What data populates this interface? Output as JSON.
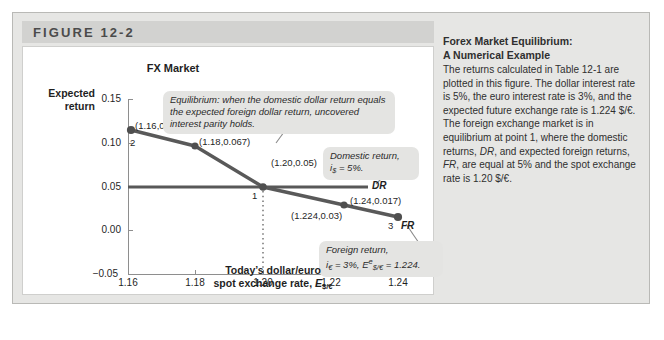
{
  "figure": {
    "header_label": "FIGURE 12-2",
    "chart_title": "FX Market"
  },
  "caption": {
    "title": "Forex Market Equilibrium:\nA Numerical Example",
    "body_html": "The returns calculated in Table 12-1 are plotted in this figure. The dollar interest rate is 5%, the euro interest rate is 3%, and the expected future exchange rate is 1.224 $/€. The foreign exchange market is in equilibrium at point 1, where the domestic returns, <i>DR</i>, and expected foreign returns, <i>FR</i>, are equal at 5% and the spot exchange rate is 1.20 $/€."
  },
  "axes": {
    "ylabel": "Expected\nreturn",
    "xlabel_line1": "Today’s dollar/euro",
    "xlabel_line2_prefix": "spot exchange rate, ",
    "xlabel_symbol": "E",
    "xlabel_symbol_sub": "$/€",
    "yticks": [
      "0.15",
      "0.10",
      "0.05",
      "0.00",
      "−0.05"
    ],
    "xticks": [
      "1.16",
      "1.18",
      "1.20",
      "1.22",
      "1.24"
    ]
  },
  "annotations": {
    "equilibrium_callout": "Equilibrium: when the domestic dollar return equals the expected foreign dollar return, uncovered interest parity holds.",
    "domestic_callout_line1": "Domestic return,",
    "domestic_callout_line2_prefix": "i",
    "domestic_callout_line2_sub": "$",
    "domestic_callout_line2_rest": " = 5%.",
    "foreign_callout_line1": "Foreign return,",
    "foreign_callout_line2_a_prefix": "i",
    "foreign_callout_line2_a_sub": "€",
    "foreign_callout_line2_a_rest": " = 3%, ",
    "foreign_callout_line2_b_symbol": "E",
    "foreign_callout_line2_b_sup": "e",
    "foreign_callout_line2_b_sub": "$/€",
    "foreign_callout_line2_b_rest": " = 1.224.",
    "dr_tag": "DR",
    "fr_tag": "FR"
  },
  "point_numbers": {
    "p2": "2",
    "p1": "1",
    "p3": "3"
  },
  "colors": {
    "fr_line": "#595959",
    "dr_line": "#585858",
    "marker": "#4f4f4f",
    "axis": "#8e8e8e",
    "callout_bg": "#e4e4e2",
    "frame_bg": "#e6e6e4",
    "header_bg": "#d2d2d0"
  },
  "chart_data": {
    "type": "line",
    "title": "FX Market",
    "xlabel": "Today’s dollar/euro spot exchange rate, E$/€",
    "ylabel": "Expected return",
    "xlim": [
      1.16,
      1.24
    ],
    "ylim": [
      -0.05,
      0.15
    ],
    "grid": false,
    "legend_position": "inline-right",
    "series": [
      {
        "name": "FR",
        "label": "Foreign return (expected)",
        "x": [
          1.16,
          1.18,
          1.2,
          1.224,
          1.24
        ],
        "y": [
          0.085,
          0.067,
          0.05,
          0.03,
          0.017
        ],
        "point_labels": [
          "(1.16,0.085)",
          "(1.18,0.067)",
          "(1.20,0.05)",
          "(1.224,0.03)",
          "(1.24,0.017)"
        ],
        "marked_points": [
          "2",
          "1",
          "3"
        ]
      },
      {
        "name": "DR",
        "label": "Domestic return",
        "x": [
          1.16,
          1.24
        ],
        "y": [
          0.05,
          0.05
        ]
      }
    ],
    "equilibrium_point": {
      "x": 1.2,
      "y": 0.05,
      "label": "1"
    },
    "annotations": [
      "Equilibrium: when the domestic dollar return equals the expected foreign dollar return, uncovered interest parity holds.",
      "Domestic return, i$ = 5%.",
      "Foreign return, i€ = 3%, E^e$/€ = 1.224."
    ]
  }
}
